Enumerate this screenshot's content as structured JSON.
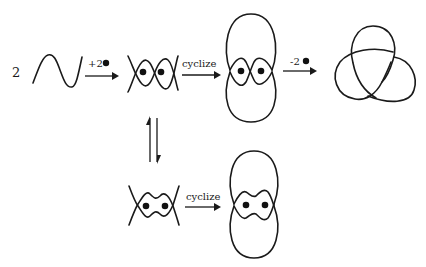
{
  "diagram": {
    "top_row": {
      "coefficient": "2",
      "step1_label": "+2",
      "step2_label": "cyclize",
      "step3_label": "-2"
    },
    "equilibrium": {
      "symbol": "reversible-arrows-vertical"
    },
    "bottom_row": {
      "step_label": "cyclize"
    },
    "nodes": [
      {
        "id": "sine-strand",
        "description": "single sine-shaped strand (x2)"
      },
      {
        "id": "double-helix-open",
        "description": "two strands crossing with 2 bound dots"
      },
      {
        "id": "cyclized-top",
        "description": "cyclized figure-eight-like loop with 2 dots"
      },
      {
        "id": "trefoil-knot",
        "description": "trefoil knot product"
      },
      {
        "id": "wavy-open",
        "description": "alternate open conformation with 2 dots"
      },
      {
        "id": "cyclized-bottom",
        "description": "cyclized alternate conformation with 2 dots"
      }
    ],
    "colors": {
      "ink": "#1a1a1a",
      "background": "#ffffff"
    }
  }
}
